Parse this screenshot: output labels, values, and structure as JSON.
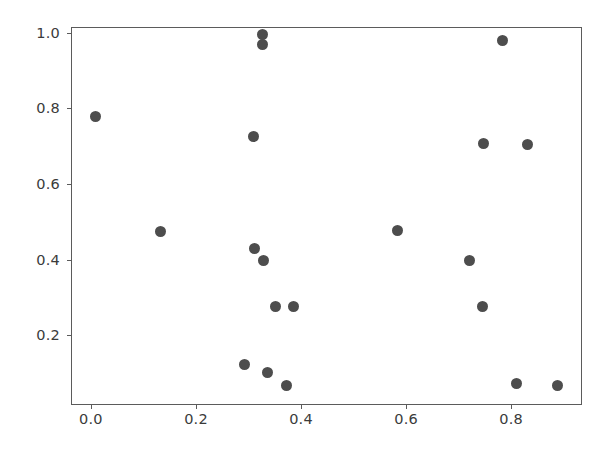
{
  "chart_data": {
    "type": "scatter",
    "title": "",
    "xlabel": "",
    "ylabel": "",
    "xlim": [
      -0.038,
      0.935
    ],
    "ylim": [
      0.0155,
      1.0155
    ],
    "grid": false,
    "legend": null,
    "marker": {
      "color": "#4d4d4d",
      "shape": "circle",
      "size_px": 11
    },
    "xticks": [
      0.0,
      0.2,
      0.4,
      0.6,
      0.8
    ],
    "yticks": [
      0.2,
      0.4,
      0.6,
      0.8,
      1.0
    ],
    "xtick_labels": [
      "0.0",
      "0.2",
      "0.4",
      "0.6",
      "0.8"
    ],
    "ytick_labels": [
      "0.2",
      "0.4",
      "0.6",
      "0.8",
      "1.0"
    ],
    "series": [
      {
        "name": "points",
        "points": [
          {
            "x": 0.006,
            "y": 0.782
          },
          {
            "x": 0.131,
            "y": 0.477
          },
          {
            "x": 0.291,
            "y": 0.126
          },
          {
            "x": 0.307,
            "y": 0.729
          },
          {
            "x": 0.31,
            "y": 0.432
          },
          {
            "x": 0.324,
            "y": 0.997
          },
          {
            "x": 0.324,
            "y": 0.971
          },
          {
            "x": 0.326,
            "y": 0.4
          },
          {
            "x": 0.335,
            "y": 0.105
          },
          {
            "x": 0.349,
            "y": 0.279
          },
          {
            "x": 0.37,
            "y": 0.071
          },
          {
            "x": 0.383,
            "y": 0.279
          },
          {
            "x": 0.581,
            "y": 0.479
          },
          {
            "x": 0.718,
            "y": 0.4
          },
          {
            "x": 0.743,
            "y": 0.279
          },
          {
            "x": 0.745,
            "y": 0.711
          },
          {
            "x": 0.781,
            "y": 0.982
          },
          {
            "x": 0.808,
            "y": 0.074
          },
          {
            "x": 0.829,
            "y": 0.708
          },
          {
            "x": 0.886,
            "y": 0.071
          }
        ]
      }
    ]
  },
  "figure": {
    "background_color": "#ffffff",
    "axes_edge_color": "#5b5b5b",
    "tick_label_color": "#3b3b3b"
  }
}
